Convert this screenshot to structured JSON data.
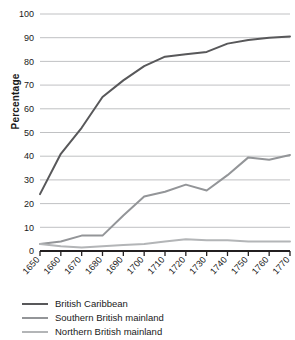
{
  "chart_data": {
    "type": "line",
    "title": "",
    "xlabel": "",
    "ylabel": "Percentage",
    "ylim": [
      0,
      100
    ],
    "ytick_step": 10,
    "yticks": [
      0,
      10,
      20,
      30,
      40,
      50,
      60,
      70,
      80,
      90,
      100
    ],
    "grid": "horizontal",
    "legend_position": "below",
    "x": [
      1650,
      1660,
      1670,
      1680,
      1690,
      1700,
      1710,
      1720,
      1730,
      1740,
      1750,
      1760,
      1770
    ],
    "xtick_labels": [
      "1650",
      "1660",
      "1670",
      "1680",
      "1690",
      "1700",
      "1710",
      "1720",
      "1730",
      "1740",
      "1750",
      "1760",
      "1770"
    ],
    "series": [
      {
        "name": "British Caribbean",
        "color": "#58585a",
        "values": [
          24,
          41,
          52,
          65,
          72,
          78,
          82,
          83,
          84,
          87.5,
          89,
          90,
          90.5
        ]
      },
      {
        "name": "Southern British mainland",
        "color": "#939598",
        "values": [
          3,
          4,
          6.5,
          6.5,
          15,
          23,
          25,
          28,
          25.5,
          32,
          39.5,
          38.5,
          40.5
        ]
      },
      {
        "name": "Northern British mainland",
        "color": "#b3b5b7",
        "values": [
          3,
          2,
          1.5,
          2,
          2.5,
          3,
          4,
          5,
          4.5,
          4.5,
          4,
          4,
          4
        ]
      }
    ]
  },
  "axis": {
    "gridline_color": "#b9babc",
    "axis_line_color": "#231f20"
  }
}
